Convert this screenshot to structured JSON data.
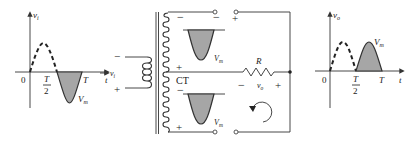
{
  "colors": {
    "line": "#333333",
    "shade": "#a6a6a6",
    "background": "#ffffff"
  },
  "input_graph": {
    "y_label_main": "v",
    "y_label_sub": "i",
    "x_label": "t",
    "origin": "0",
    "half_period_num": "T",
    "half_period_den": "2",
    "period": "T",
    "peak_label_main": "V",
    "peak_label_sub": "m"
  },
  "transformer": {
    "primary_minus": "−",
    "primary_plus": "+",
    "primary_label_main": "v",
    "primary_label_sub": "i",
    "center_tap": "CT",
    "upper_minus_left": "−",
    "upper_minus_right": "−",
    "upper_plus": "+",
    "upper_plus_top": "+",
    "upper_peak_main": "V",
    "upper_peak_sub": "m",
    "lower_minus": "−",
    "lower_plus": "+",
    "lower_peak_main": "V",
    "lower_peak_sub": "m"
  },
  "load": {
    "resistor_label": "R",
    "output_label_main": "v",
    "output_label_sub": "o",
    "minus": "−",
    "plus": "+",
    "current_direction": "counter-clockwise"
  },
  "output_graph": {
    "y_label_main": "v",
    "y_label_sub": "o",
    "x_label": "t",
    "origin": "0",
    "half_period_num": "T",
    "half_period_den": "2",
    "period": "T",
    "peak_label_main": "V",
    "peak_label_sub": "m"
  }
}
